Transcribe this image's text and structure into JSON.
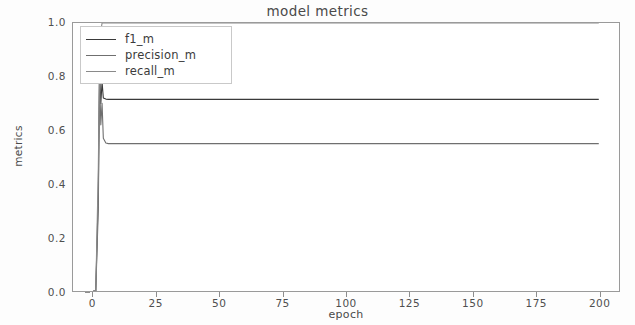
{
  "chart_data": {
    "type": "line",
    "title": "model metrics",
    "xlabel": "epoch",
    "ylabel": "metrics",
    "xlim": [
      -8,
      208
    ],
    "ylim": [
      0.0,
      1.0
    ],
    "grid": false,
    "legend_position": "upper left",
    "xticks": [
      0,
      25,
      50,
      75,
      100,
      125,
      150,
      175,
      200
    ],
    "xtick_labels": [
      "0",
      "25",
      "50",
      "75",
      "100",
      "125",
      "150",
      "175",
      "200"
    ],
    "yticks": [
      0.0,
      0.2,
      0.4,
      0.6,
      0.8,
      1.0
    ],
    "ytick_labels": [
      "0.0",
      "0.2",
      "0.4",
      "0.6",
      "0.8",
      "1.0"
    ],
    "series": [
      {
        "name": "f1_m",
        "color": "#3a3a3a",
        "plateau": 0.715,
        "x": [
          0,
          1,
          2,
          2.5,
          3,
          3.5,
          4,
          5,
          6,
          8,
          12,
          20,
          40,
          60,
          80,
          100,
          125,
          150,
          175,
          200
        ],
        "values": [
          0.0,
          0.0,
          0.36,
          0.82,
          0.7,
          0.78,
          0.72,
          0.716,
          0.715,
          0.715,
          0.715,
          0.715,
          0.715,
          0.715,
          0.715,
          0.715,
          0.715,
          0.715,
          0.715,
          0.715
        ]
      },
      {
        "name": "precision_m",
        "color": "#6f6f6f",
        "plateau": 0.55,
        "x": [
          0,
          1,
          2,
          2.5,
          3,
          3.5,
          4,
          5,
          6,
          8,
          12,
          20,
          40,
          60,
          80,
          100,
          125,
          150,
          175,
          200
        ],
        "values": [
          0.0,
          0.0,
          0.3,
          0.8,
          0.62,
          0.7,
          0.57,
          0.552,
          0.55,
          0.55,
          0.55,
          0.55,
          0.55,
          0.55,
          0.55,
          0.55,
          0.55,
          0.55,
          0.55,
          0.55
        ]
      },
      {
        "name": "recall_m",
        "color": "#8a8a8a",
        "plateau": 1.0,
        "x": [
          0,
          1,
          2,
          2.5,
          3,
          3.5,
          4,
          5,
          6,
          8,
          12,
          20,
          40,
          60,
          80,
          100,
          125,
          150,
          175,
          200
        ],
        "values": [
          0.0,
          0.0,
          0.45,
          0.84,
          0.97,
          1.0,
          1.0,
          1.0,
          1.0,
          1.0,
          1.0,
          1.0,
          1.0,
          1.0,
          1.0,
          1.0,
          1.0,
          1.0,
          1.0,
          1.0
        ]
      }
    ]
  }
}
